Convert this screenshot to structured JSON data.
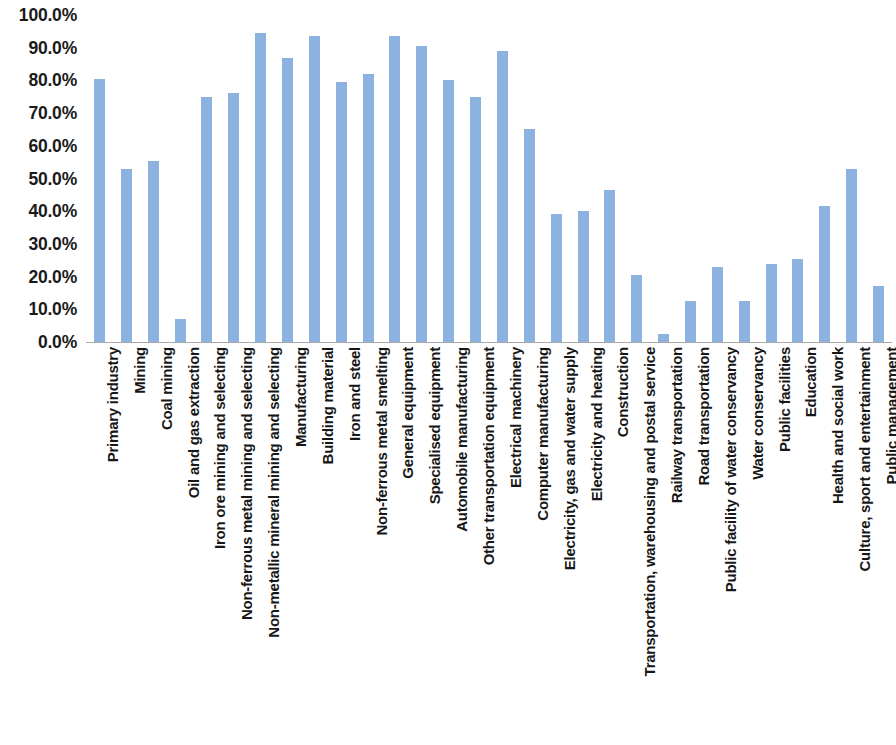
{
  "chart_data": {
    "type": "bar",
    "title": "",
    "subtitle": "",
    "xlabel": "",
    "ylabel": "",
    "ylim": [
      0,
      100
    ],
    "ytick_labels": [
      "100.0%",
      "90.0%",
      "80.0%",
      "70.0%",
      "60.0%",
      "50.0%",
      "40.0%",
      "30.0%",
      "20.0%",
      "10.0%",
      "0.0%"
    ],
    "ytick_values": [
      100,
      90,
      80,
      70,
      60,
      50,
      40,
      30,
      20,
      10,
      0
    ],
    "grid": false,
    "legend": null,
    "bar_color": "#8cb3e0",
    "axis_color": "#a8a8a8",
    "categories": [
      "Primary industry",
      "Mining",
      "Coal mining",
      "Oil and gas extraction",
      "Iron ore mining and selecting",
      "Non-ferrous metal mining and selecting",
      "Non-metallic mineral mining and selecting",
      "Manufacturing",
      "Building material",
      "Iron and steel",
      "Non-ferrous metal smelting",
      "General equipment",
      "Specialised equipment",
      "Automobile manufacturing",
      "Other transportation equipment",
      "Electrical machinery",
      "Computer manufacturing",
      "Electricity, gas and water supply",
      "Electricity and heating",
      "Construction",
      "Transportation, warehousing and postal service",
      "Railway transportation",
      "Road transportation",
      "Public facility of water conservancy",
      "Water conservancy",
      "Public facilities",
      "Education",
      "Health and social work",
      "Culture, sport and entertainment",
      "Public management"
    ],
    "values": [
      80.5,
      53.0,
      55.5,
      7.0,
      75.0,
      76.0,
      94.5,
      87.0,
      93.5,
      79.5,
      82.0,
      93.5,
      90.5,
      80.0,
      75.0,
      89.0,
      65.0,
      39.0,
      40.0,
      46.5,
      20.5,
      2.5,
      12.5,
      23.0,
      12.5,
      24.0,
      25.5,
      41.5,
      53.0,
      17.0
    ]
  }
}
